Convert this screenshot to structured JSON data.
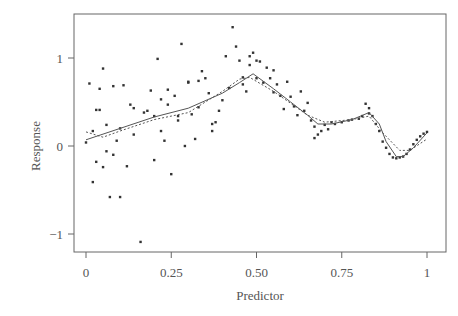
{
  "chart_data": {
    "type": "scatter",
    "title": "",
    "xlabel": "Predictor",
    "ylabel": "Response",
    "xlim": [
      -0.035,
      1.05
    ],
    "ylim": [
      -1.2,
      1.5
    ],
    "grid": false,
    "legend": null,
    "x_ticks": [
      0,
      0.25,
      0.5,
      0.75,
      1
    ],
    "x_tick_labels": [
      "0",
      "0.25",
      "0.50",
      "0.75",
      "1"
    ],
    "y_ticks": [
      1,
      0,
      -1
    ],
    "y_tick_labels": [
      "1",
      "0",
      "−1"
    ],
    "points": [
      [
        0.0,
        0.04
      ],
      [
        0.01,
        0.71
      ],
      [
        0.02,
        -0.41
      ],
      [
        0.02,
        0.17
      ],
      [
        0.03,
        0.41
      ],
      [
        0.03,
        -0.18
      ],
      [
        0.04,
        0.65
      ],
      [
        0.04,
        0.41
      ],
      [
        0.05,
        -0.24
      ],
      [
        0.05,
        0.88
      ],
      [
        0.06,
        0.24
      ],
      [
        0.06,
        -0.06
      ],
      [
        0.07,
        -0.58
      ],
      [
        0.08,
        0.68
      ],
      [
        0.08,
        -0.1
      ],
      [
        0.09,
        0.06
      ],
      [
        0.1,
        -0.58
      ],
      [
        0.1,
        0.2
      ],
      [
        0.11,
        0.69
      ],
      [
        0.12,
        -0.23
      ],
      [
        0.13,
        0.47
      ],
      [
        0.14,
        0.13
      ],
      [
        0.14,
        0.43
      ],
      [
        0.16,
        -1.09
      ],
      [
        0.17,
        0.38
      ],
      [
        0.18,
        0.4
      ],
      [
        0.19,
        0.63
      ],
      [
        0.2,
        0.34
      ],
      [
        0.2,
        -0.16
      ],
      [
        0.21,
        0.99
      ],
      [
        0.22,
        0.53
      ],
      [
        0.22,
        0.17
      ],
      [
        0.23,
        0.06
      ],
      [
        0.24,
        0.64
      ],
      [
        0.24,
        0.47
      ],
      [
        0.25,
        -0.32
      ],
      [
        0.26,
        0.57
      ],
      [
        0.27,
        0.34
      ],
      [
        0.27,
        0.29
      ],
      [
        0.28,
        1.16
      ],
      [
        0.29,
        0.0
      ],
      [
        0.3,
        0.73
      ],
      [
        0.3,
        0.72
      ],
      [
        0.31,
        0.36
      ],
      [
        0.32,
        0.08
      ],
      [
        0.33,
        0.44
      ],
      [
        0.33,
        0.74
      ],
      [
        0.34,
        0.85
      ],
      [
        0.35,
        0.77
      ],
      [
        0.36,
        0.6
      ],
      [
        0.37,
        0.25
      ],
      [
        0.37,
        0.17
      ],
      [
        0.38,
        0.27
      ],
      [
        0.39,
        0.4
      ],
      [
        0.4,
        0.52
      ],
      [
        0.41,
        1.02
      ],
      [
        0.42,
        0.66
      ],
      [
        0.43,
        1.35
      ],
      [
        0.44,
        1.13
      ],
      [
        0.45,
        0.97
      ],
      [
        0.46,
        0.78
      ],
      [
        0.46,
        0.7
      ],
      [
        0.47,
        0.62
      ],
      [
        0.48,
        0.92
      ],
      [
        0.48,
        1.02
      ],
      [
        0.49,
        1.06
      ],
      [
        0.5,
        0.97
      ],
      [
        0.5,
        0.77
      ],
      [
        0.51,
        0.96
      ],
      [
        0.52,
        0.72
      ],
      [
        0.53,
        0.89
      ],
      [
        0.54,
        0.77
      ],
      [
        0.55,
        0.61
      ],
      [
        0.55,
        0.86
      ],
      [
        0.56,
        0.7
      ],
      [
        0.57,
        0.57
      ],
      [
        0.58,
        0.42
      ],
      [
        0.59,
        0.73
      ],
      [
        0.6,
        0.56
      ],
      [
        0.61,
        0.45
      ],
      [
        0.62,
        0.35
      ],
      [
        0.63,
        0.62
      ],
      [
        0.64,
        0.4
      ],
      [
        0.65,
        0.49
      ],
      [
        0.66,
        0.29
      ],
      [
        0.67,
        0.22
      ],
      [
        0.67,
        0.09
      ],
      [
        0.68,
        0.13
      ],
      [
        0.69,
        0.17
      ],
      [
        0.7,
        0.24
      ],
      [
        0.71,
        0.19
      ],
      [
        0.72,
        0.27
      ],
      [
        0.73,
        0.25
      ],
      [
        0.75,
        0.27
      ],
      [
        0.77,
        0.29
      ],
      [
        0.78,
        0.3
      ],
      [
        0.8,
        0.31
      ],
      [
        0.81,
        0.34
      ],
      [
        0.82,
        0.48
      ],
      [
        0.83,
        0.43
      ],
      [
        0.83,
        0.37
      ],
      [
        0.84,
        0.34
      ],
      [
        0.85,
        0.25
      ],
      [
        0.86,
        0.17
      ],
      [
        0.87,
        0.05
      ],
      [
        0.88,
        -0.02
      ],
      [
        0.89,
        -0.09
      ],
      [
        0.9,
        -0.13
      ],
      [
        0.91,
        -0.14
      ],
      [
        0.92,
        -0.13
      ],
      [
        0.93,
        -0.12
      ],
      [
        0.94,
        -0.09
      ],
      [
        0.95,
        -0.04
      ],
      [
        0.96,
        0.02
      ],
      [
        0.97,
        0.07
      ],
      [
        0.98,
        0.11
      ],
      [
        0.99,
        0.14
      ],
      [
        1.0,
        0.16
      ]
    ],
    "series": [
      {
        "name": "fit-solid",
        "style": "solid",
        "x": [
          0.0,
          0.1,
          0.2,
          0.3,
          0.4,
          0.45,
          0.49,
          0.55,
          0.6,
          0.65,
          0.68,
          0.72,
          0.78,
          0.83,
          0.86,
          0.88,
          0.91,
          0.93,
          0.96,
          1.0
        ],
        "y": [
          0.07,
          0.2,
          0.33,
          0.43,
          0.6,
          0.72,
          0.82,
          0.65,
          0.5,
          0.35,
          0.25,
          0.25,
          0.3,
          0.38,
          0.25,
          0.05,
          -0.12,
          -0.12,
          -0.02,
          0.15
        ]
      },
      {
        "name": "fit-dashed",
        "style": "dashed",
        "x": [
          0.0,
          0.05,
          0.1,
          0.2,
          0.3,
          0.4,
          0.45,
          0.48,
          0.55,
          0.65,
          0.7,
          0.78,
          0.83,
          0.87,
          0.92,
          0.95,
          1.0
        ],
        "y": [
          0.16,
          0.1,
          0.17,
          0.3,
          0.38,
          0.62,
          0.76,
          0.78,
          0.62,
          0.35,
          0.27,
          0.3,
          0.34,
          0.15,
          -0.05,
          -0.05,
          0.08
        ]
      }
    ]
  },
  "axes": {
    "xlabel": "Predictor",
    "ylabel": "Response"
  },
  "colors": {
    "frame": "#666666",
    "points": "#333333",
    "lines": "#555555",
    "text": "#555555"
  }
}
